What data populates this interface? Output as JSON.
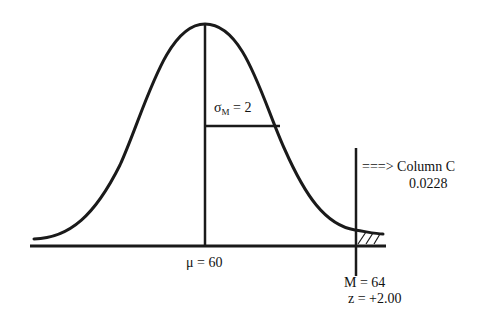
{
  "diagram": {
    "type": "normal-distribution-of-sample-means",
    "colors": {
      "line": "#1a1a1a",
      "background": "#ffffff"
    },
    "labels": {
      "sigma_symbol": "σ",
      "sigma_subscript": "M",
      "sigma_value": " = 2",
      "mu_label": "μ = 60",
      "arrow_text": "===> Column C",
      "proportion": "0.0228",
      "sample_mean": "M = 64",
      "z_score": "z = +2.00"
    },
    "values": {
      "mu": 60,
      "sigma_m": 2,
      "sample_mean": 64,
      "z": 2.0,
      "tail_proportion": 0.0228
    }
  }
}
